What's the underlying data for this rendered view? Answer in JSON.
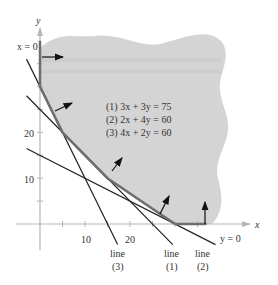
{
  "figure": {
    "axes": {
      "x_label": "x",
      "y_label": "y",
      "x_ticks": [
        "10",
        "20"
      ],
      "y_ticks": [
        "10",
        "20"
      ]
    },
    "boundary_labels": {
      "x_zero": "x = 0",
      "y_zero": "y = 0"
    },
    "equations": [
      "(1) 3x + 3y = 75",
      "(2) 2x + 4y = 60",
      "(3) 4x + 2y = 60"
    ],
    "line_labels": [
      {
        "word": "line",
        "num": "(3)"
      },
      {
        "word": "line",
        "num": "(1)"
      },
      {
        "word": "line",
        "num": "(2)"
      }
    ],
    "colors": {
      "region": "#d3d3d3",
      "boundary": "#6e6e6e",
      "line": "#222222",
      "axis": "#b5b5b5"
    }
  },
  "chart_data": {
    "type": "line",
    "title": "",
    "xlabel": "x",
    "ylabel": "y",
    "xlim": [
      -3,
      40
    ],
    "ylim": [
      -8,
      42
    ],
    "lines": [
      {
        "name": "line (1)",
        "equation": "3x + 3y = 75",
        "a": 3,
        "b": 3,
        "c": 75
      },
      {
        "name": "line (2)",
        "equation": "2x + 4y = 60",
        "a": 2,
        "b": 4,
        "c": 60
      },
      {
        "name": "line (3)",
        "equation": "4x + 2y = 60",
        "a": 4,
        "b": 2,
        "c": 60
      }
    ],
    "feasible_region_vertices": [
      [
        0,
        30
      ],
      [
        5,
        20
      ],
      [
        15,
        10
      ],
      [
        30,
        0
      ]
    ],
    "feasible_region": "unbounded, shaded above the boundary"
  }
}
